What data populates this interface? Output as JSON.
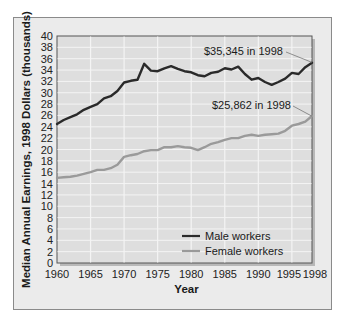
{
  "chart_data": {
    "type": "line",
    "title": "",
    "xlabel": "Year",
    "ylabel": "Median Annual Earnings, 1998 Dollars (thousands)",
    "xlim": [
      1960,
      1998
    ],
    "ylim": [
      0,
      40
    ],
    "grid": true,
    "legend_position": "lower right",
    "x_ticks": [
      "1960",
      "1965",
      "1970",
      "1975",
      "1980",
      "1985",
      "1990",
      "1995",
      "1998"
    ],
    "y_ticks": [
      "0",
      "2",
      "4",
      "6",
      "8",
      "10",
      "12",
      "14",
      "16",
      "18",
      "20",
      "22",
      "24",
      "26",
      "28",
      "30",
      "32",
      "34",
      "36",
      "38",
      "40"
    ],
    "x": [
      1960,
      1961,
      1962,
      1963,
      1964,
      1965,
      1966,
      1967,
      1968,
      1969,
      1970,
      1971,
      1972,
      1973,
      1974,
      1975,
      1976,
      1977,
      1978,
      1979,
      1980,
      1981,
      1982,
      1983,
      1984,
      1985,
      1986,
      1987,
      1988,
      1989,
      1990,
      1991,
      1992,
      1993,
      1994,
      1995,
      1996,
      1997,
      1998
    ],
    "series": [
      {
        "name": "Male workers",
        "color": "#2a2a2a",
        "values": [
          24.5,
          25.2,
          25.7,
          26.2,
          27.0,
          27.5,
          28.0,
          29.0,
          29.4,
          30.3,
          31.8,
          32.1,
          32.3,
          35.1,
          33.9,
          33.8,
          34.3,
          34.7,
          34.2,
          33.8,
          33.6,
          33.1,
          32.9,
          33.5,
          33.7,
          34.3,
          34.1,
          34.6,
          33.3,
          32.3,
          32.6,
          31.9,
          31.4,
          31.9,
          32.5,
          33.5,
          33.3,
          34.5,
          35.3
        ]
      },
      {
        "name": "Female workers",
        "color": "#9a9a9a",
        "values": [
          15.0,
          15.1,
          15.2,
          15.4,
          15.7,
          16.0,
          16.4,
          16.4,
          16.7,
          17.3,
          18.7,
          19.0,
          19.2,
          19.7,
          19.9,
          19.9,
          20.4,
          20.4,
          20.6,
          20.4,
          20.3,
          19.9,
          20.4,
          21.0,
          21.3,
          21.7,
          22.0,
          22.0,
          22.4,
          22.6,
          22.4,
          22.6,
          22.7,
          22.8,
          23.3,
          24.2,
          24.5,
          24.9,
          25.9
        ]
      }
    ],
    "annotations": [
      {
        "text": "$35,345 in 1998",
        "series": "Male workers",
        "x": 1998,
        "y": 35.345
      },
      {
        "text": "$25,862 in 1998",
        "series": "Female workers",
        "x": 1998,
        "y": 25.862
      }
    ]
  },
  "colors": {
    "panel_bg": "#ebebeb",
    "plot_bg": "#dedede",
    "grid": "#f4f4f4",
    "male_line": "#2a2a2a",
    "female_line": "#9a9a9a"
  }
}
